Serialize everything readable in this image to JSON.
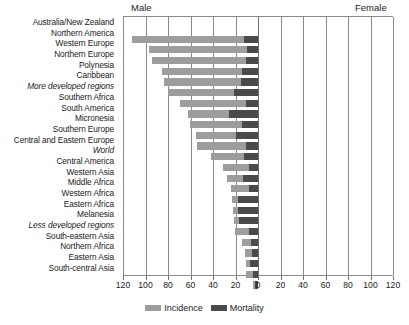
{
  "chart_data": {
    "type": "bar",
    "title": "",
    "subtitle": "",
    "orientation": "horizontal-diverging",
    "xlabel": "",
    "ylabel": "",
    "panels": [
      {
        "name": "Male",
        "side": "left",
        "xlim": [
          120,
          0
        ]
      },
      {
        "name": "Female",
        "side": "right",
        "xlim": [
          0,
          120
        ]
      }
    ],
    "xticks": [
      120,
      100,
      80,
      60,
      40,
      20,
      0,
      20,
      40,
      60,
      80,
      100,
      120
    ],
    "grid": true,
    "legend_position": "bottom-center",
    "legend": [
      "Incidence",
      "Mortality"
    ],
    "colors": {
      "incidence": "#9d9d9d",
      "mortality": "#4a4a4a"
    },
    "categories": [
      "Australia/New Zealand",
      "Northern America",
      "Western Europe",
      "Northern Europe",
      "Polynesia",
      "Caribbean",
      "More developed regions",
      "Southern Africa",
      "South America",
      "Micronesia",
      "Southern Europe",
      "Central and Eastern Europe",
      "World",
      "Central America",
      "Western Asia",
      "Middle Africa",
      "Western Africa",
      "Eastern Africa",
      "Melanesia",
      "Less developed regions",
      "South-eastern Asia",
      "Northern Africa",
      "Eastern Asia",
      "South-central Asia"
    ],
    "italic_categories": [
      "More developed regions",
      "World",
      "Less developed regions"
    ],
    "series": [
      {
        "name": "Incidence",
        "side": "Male",
        "values": [
          111.6,
          97.2,
          94.1,
          85.0,
          83.4,
          79.8,
          69.5,
          61.8,
          60.1,
          55.2,
          54.1,
          41.8,
          31.1,
          28.0,
          24.3,
          23.2,
          22.2,
          21.0,
          20.1,
          14.5,
          11.2,
          10.5,
          10.5,
          4.5
        ]
      },
      {
        "name": "Mortality",
        "side": "Male",
        "values": [
          12.8,
          9.8,
          10.7,
          14.3,
          15.3,
          21.5,
          10.3,
          25.4,
          14.6,
          19.7,
          10.5,
          12.1,
          7.8,
          13.0,
          8.4,
          17.5,
          18.2,
          17.0,
          8.2,
          6.6,
          5.7,
          7.3,
          4.6,
          2.6
        ]
      }
    ],
    "female_panel_empty": true
  },
  "chart": {
    "male_label": "Male",
    "female_label": "Female",
    "legend": {
      "incidence_label": "Incidence",
      "mortality_label": "Mortality"
    }
  }
}
